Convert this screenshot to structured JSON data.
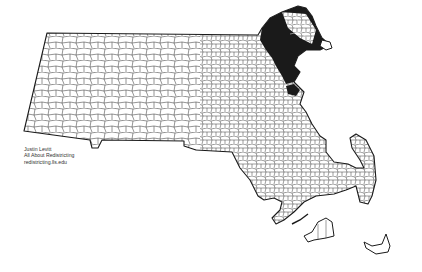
{
  "map": {
    "title": "Massachusetts municipalities - congressional district highlight",
    "region": "Massachusetts",
    "highlighted_district": {
      "label": "Northeast district (Essex County coast)",
      "fill_color": "#1a1a1a"
    },
    "colors": {
      "background": "#ffffff",
      "state_fill": "#ffffff",
      "outline": "#1a1a1a",
      "town_borders": "#3a3a3a"
    },
    "islands": [
      "Martha's Vineyard",
      "Nantucket"
    ]
  },
  "credit": {
    "author": "Justin Levitt",
    "project": "All About Redistricting",
    "site": "redistricting.lls.edu"
  }
}
